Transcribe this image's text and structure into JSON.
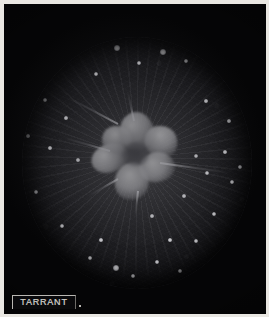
{
  "image": {
    "kind": "astronomical-photographic-plate",
    "medium": "black-and-white halftone photograph on dark card",
    "width_px": 269,
    "height_px": 317,
    "mount_border_color": "#e9e7e2",
    "card_color": "#050506"
  },
  "field": {
    "label": "circular telescope field of view",
    "shape": "ellipse",
    "center_x_px": 133,
    "center_y_px": 159,
    "width_px": 230,
    "height_px": 252,
    "background_color": "#1d1d20",
    "edge_color": "#060608"
  },
  "subject": {
    "name": "bright irregular nebulous cluster",
    "description": "star-shaped multi-lobed luminous mass with a darker core and radial streaks",
    "center_x_px": 133,
    "center_y_px": 153,
    "core_color": "#e8e8ea",
    "lobe_color": "#c4c4c8",
    "core_shadow_color": "#4a4a50",
    "lobe_count": 6,
    "halo_color": "#bebec3"
  },
  "rays": {
    "label": "radial streaks",
    "count": 60,
    "color": "#b4b4ba",
    "origin": "nucleus"
  },
  "spikes": [
    {
      "name": "spike-upper-left",
      "x": 118,
      "y": 123,
      "length": 56,
      "angle_deg": 208,
      "thickness": 2
    },
    {
      "name": "spike-upper",
      "x": 134,
      "y": 120,
      "length": 30,
      "angle_deg": 258,
      "thickness": 2
    },
    {
      "name": "spike-left",
      "x": 110,
      "y": 150,
      "length": 48,
      "angle_deg": 196,
      "thickness": 2
    },
    {
      "name": "spike-right",
      "x": 160,
      "y": 162,
      "length": 70,
      "angle_deg": 8,
      "thickness": 2
    },
    {
      "name": "spike-lower-left",
      "x": 118,
      "y": 178,
      "length": 34,
      "angle_deg": 150,
      "thickness": 2
    },
    {
      "name": "spike-lower",
      "x": 138,
      "y": 190,
      "length": 26,
      "angle_deg": 96,
      "thickness": 2
    }
  ],
  "stars": [
    {
      "name": "star-1",
      "x": 117,
      "y": 48,
      "size": 4
    },
    {
      "name": "star-2",
      "x": 139,
      "y": 63,
      "size": 3
    },
    {
      "name": "star-3",
      "x": 163,
      "y": 52,
      "size": 4
    },
    {
      "name": "star-4",
      "x": 186,
      "y": 61,
      "size": 3
    },
    {
      "name": "star-5",
      "x": 96,
      "y": 74,
      "size": 3
    },
    {
      "name": "star-6",
      "x": 45,
      "y": 100,
      "size": 3
    },
    {
      "name": "star-7",
      "x": 28,
      "y": 136,
      "size": 2
    },
    {
      "name": "star-8",
      "x": 36,
      "y": 192,
      "size": 3
    },
    {
      "name": "star-9",
      "x": 62,
      "y": 226,
      "size": 3
    },
    {
      "name": "star-10",
      "x": 90,
      "y": 258,
      "size": 3
    },
    {
      "name": "star-11",
      "x": 116,
      "y": 268,
      "size": 4
    },
    {
      "name": "star-12",
      "x": 133,
      "y": 276,
      "size": 3
    },
    {
      "name": "star-13",
      "x": 157,
      "y": 262,
      "size": 3
    },
    {
      "name": "star-14",
      "x": 180,
      "y": 271,
      "size": 3
    },
    {
      "name": "star-15",
      "x": 196,
      "y": 241,
      "size": 3
    },
    {
      "name": "star-16",
      "x": 214,
      "y": 214,
      "size": 3
    },
    {
      "name": "star-17",
      "x": 232,
      "y": 182,
      "size": 3
    },
    {
      "name": "star-18",
      "x": 240,
      "y": 167,
      "size": 3
    },
    {
      "name": "star-19",
      "x": 225,
      "y": 152,
      "size": 2
    },
    {
      "name": "star-20",
      "x": 207,
      "y": 173,
      "size": 3
    },
    {
      "name": "star-21",
      "x": 196,
      "y": 156,
      "size": 3
    },
    {
      "name": "star-22",
      "x": 184,
      "y": 196,
      "size": 2
    },
    {
      "name": "star-23",
      "x": 152,
      "y": 216,
      "size": 2
    },
    {
      "name": "star-24",
      "x": 78,
      "y": 160,
      "size": 2
    },
    {
      "name": "star-25",
      "x": 66,
      "y": 118,
      "size": 2
    },
    {
      "name": "star-26",
      "x": 206,
      "y": 101,
      "size": 2
    },
    {
      "name": "star-27",
      "x": 229,
      "y": 121,
      "size": 2
    },
    {
      "name": "star-28",
      "x": 101,
      "y": 240,
      "size": 2
    },
    {
      "name": "star-29",
      "x": 170,
      "y": 240,
      "size": 2
    },
    {
      "name": "star-30",
      "x": 50,
      "y": 148,
      "size": 2
    }
  ],
  "signature": {
    "text": "TARRANT",
    "role": "engraver signature plate",
    "plate_color": "#0a0a0c",
    "text_color": "#c9c7c2",
    "border_color": "#b9b7b2"
  }
}
